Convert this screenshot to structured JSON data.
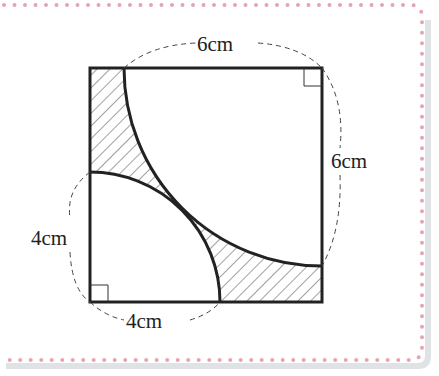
{
  "figure": {
    "top_label": "6cm",
    "right_label": "6cm",
    "left_label": "4cm",
    "bottom_label": "4cm",
    "large_square_side": "6cm",
    "small_square_side": "4cm",
    "border_dot_color": "#e8a0b0",
    "border_shadow_color": "#d8dde0",
    "hatch_color": "#333333",
    "line_color": "#222222"
  }
}
